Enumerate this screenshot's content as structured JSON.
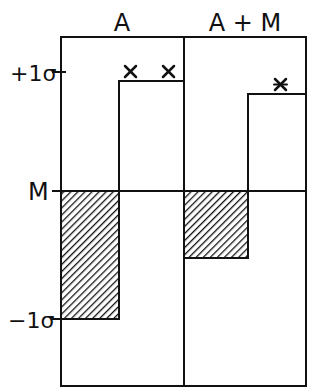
{
  "diagram": {
    "columns": [
      {
        "label": "A"
      },
      {
        "label": "A + M"
      }
    ],
    "axis_labels": {
      "plus_sigma": "+1σ",
      "mean": "M",
      "minus_sigma": "−1σ"
    },
    "markers": {
      "symbol": "✕",
      "column_A_count": 2,
      "column_AM_count": 1
    },
    "colors": {
      "line": "#111111",
      "background": "#ffffff"
    }
  }
}
